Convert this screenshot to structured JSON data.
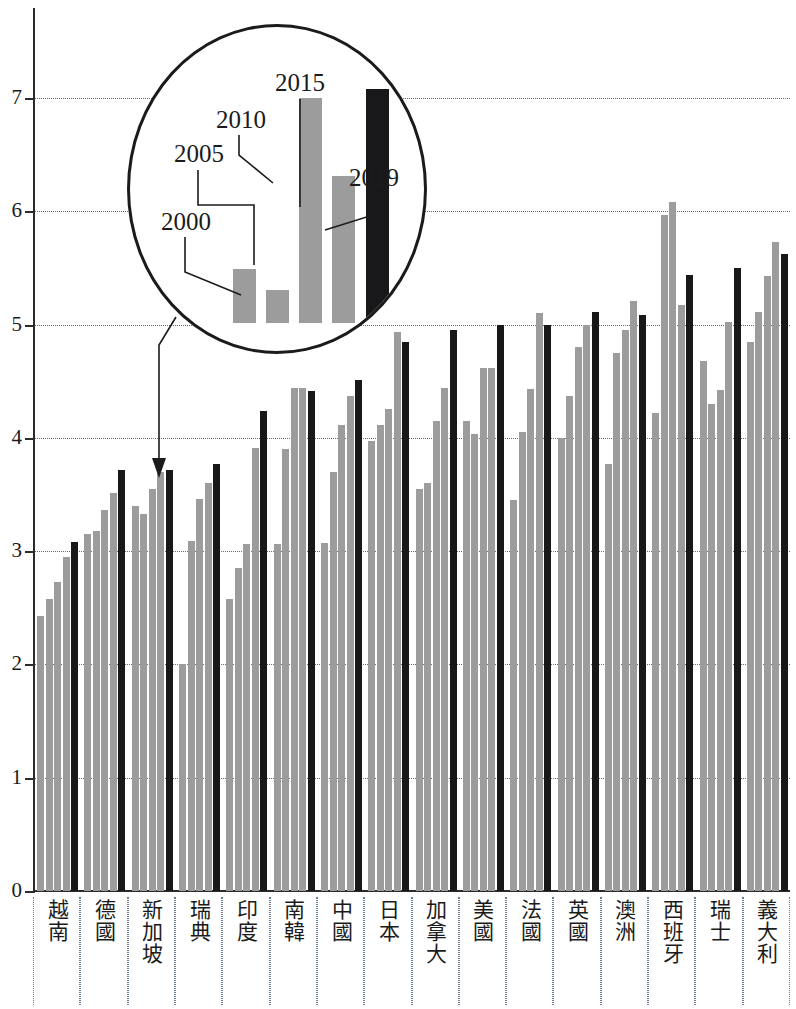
{
  "chart_data": {
    "type": "bar",
    "title": "",
    "subtitle": "",
    "xlabel": "",
    "ylabel": "",
    "ylim": [
      0,
      7.6
    ],
    "yticks": [
      0,
      1,
      2,
      3,
      4,
      5,
      6,
      7
    ],
    "ytick_labels": [
      "0",
      "1",
      "2",
      "3",
      "4",
      "5",
      "6",
      "7"
    ],
    "grid": true,
    "legend_position": "magnifier-callout",
    "categories": [
      "越南",
      "德國",
      "新加坡",
      "瑞典",
      "印度",
      "南韓",
      "中國",
      "日本",
      "加拿大",
      "美國",
      "法國",
      "英國",
      "澳洲",
      "西班牙",
      "瑞士",
      "義大利"
    ],
    "series": [
      {
        "name": "2000",
        "color": "#9c9c9c",
        "values": [
          2.43,
          3.15,
          3.4,
          2.0,
          2.58,
          3.06,
          3.07,
          3.97,
          3.55,
          4.15,
          3.45,
          4.0,
          3.77,
          4.22,
          4.68,
          4.85
        ]
      },
      {
        "name": "2005",
        "color": "#9c9c9c",
        "values": [
          2.58,
          3.18,
          3.33,
          3.09,
          2.85,
          3.9,
          3.7,
          4.11,
          3.6,
          4.03,
          4.05,
          4.37,
          4.75,
          5.97,
          4.3,
          5.11
        ]
      },
      {
        "name": "2010",
        "color": "#9c9c9c",
        "values": [
          2.73,
          3.36,
          3.55,
          3.46,
          3.06,
          4.44,
          4.11,
          4.25,
          4.15,
          4.62,
          4.43,
          4.8,
          4.95,
          6.08,
          4.42,
          5.43
        ]
      },
      {
        "name": "2015",
        "color": "#9c9c9c",
        "values": [
          2.95,
          3.51,
          3.7,
          3.6,
          3.91,
          4.44,
          4.37,
          4.93,
          4.44,
          4.62,
          5.1,
          5.0,
          5.21,
          5.17,
          5.02,
          5.73
        ]
      },
      {
        "name": "2019",
        "color": "#18181a",
        "values": [
          3.08,
          3.72,
          3.72,
          3.77,
          4.24,
          4.41,
          4.51,
          4.85,
          4.95,
          5.0,
          5.0,
          5.11,
          5.08,
          5.44,
          5.5,
          5.62
        ]
      }
    ],
    "extra_bar_note": {
      "category": "印度",
      "values": [
        2.58,
        2.85,
        3.06,
        3.91,
        4.14,
        4.24
      ]
    },
    "magnifier": {
      "source_category": "印度",
      "annotation_labels": [
        "2000",
        "2005",
        "2010",
        "2015",
        "2019"
      ],
      "bar_values": [
        5.35,
        5.2,
        6.63,
        6.05,
        6.7
      ]
    }
  },
  "axis": {
    "y_labels": [
      "7",
      "6",
      "5",
      "4",
      "3",
      "2",
      "1",
      "0"
    ]
  },
  "callout": {
    "labels": {
      "y2000": "2000",
      "y2005": "2005",
      "y2010": "2010",
      "y2015": "2015",
      "y2019": "2019"
    }
  }
}
